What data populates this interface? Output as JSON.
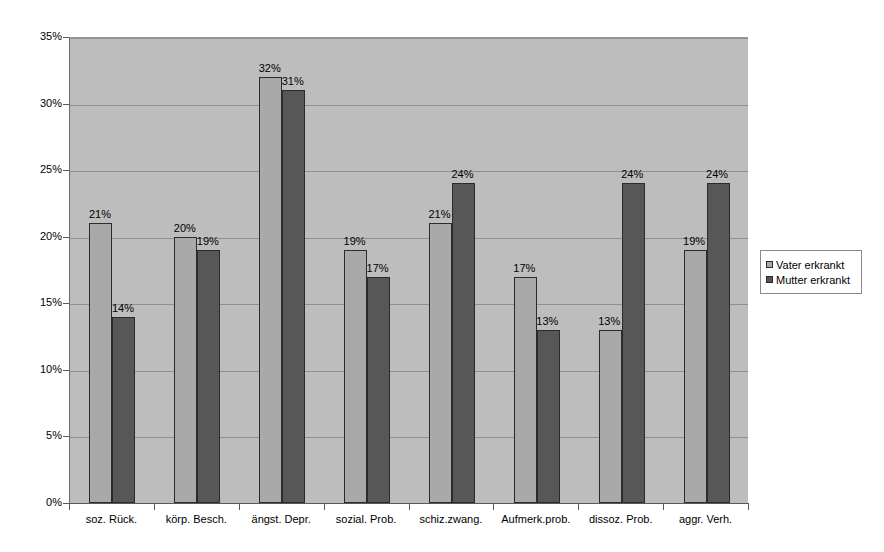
{
  "chart_data": {
    "type": "bar",
    "title": "",
    "subtitle": "",
    "xlabel": "",
    "ylabel": "",
    "ylim": [
      0,
      35
    ],
    "ytick_labels": [
      "0%",
      "5%",
      "10%",
      "15%",
      "20%",
      "25%",
      "30%",
      "35%"
    ],
    "ytick_values": [
      0,
      5,
      10,
      15,
      20,
      25,
      30,
      35
    ],
    "grid": true,
    "legend_position": "right",
    "categories": [
      "soz. Rück.",
      "körp. Besch.",
      "ängst. Depr.",
      "sozial. Prob.",
      "schiz.zwang.",
      "Aufmerk.prob.",
      "dissoz. Prob.",
      "aggr. Verh."
    ],
    "series": [
      {
        "name": "Vater erkrankt",
        "color": "#a9a9a9",
        "values": [
          21,
          20,
          32,
          19,
          21,
          17,
          13,
          19
        ],
        "labels": [
          "21%",
          "20%",
          "32%",
          "19%",
          "21%",
          "17%",
          "13%",
          "19%"
        ]
      },
      {
        "name": "Mutter erkrankt",
        "color": "#575757",
        "values": [
          14,
          19,
          31,
          17,
          24,
          13,
          24,
          24
        ],
        "labels": [
          "14%",
          "19%",
          "31%",
          "17%",
          "24%",
          "13%",
          "24%",
          "24%"
        ]
      }
    ]
  },
  "legend": {
    "entries": [
      {
        "label": "Vater erkrankt"
      },
      {
        "label": "Mutter erkrankt"
      }
    ]
  },
  "colors": {
    "plot_background": "#bdbdbd",
    "gridline": "#8f8f8f",
    "axis": "#5a5a5a",
    "bar_vater": "#a9a9a9",
    "bar_mutter": "#575757",
    "page_background": "#ffffff"
  }
}
